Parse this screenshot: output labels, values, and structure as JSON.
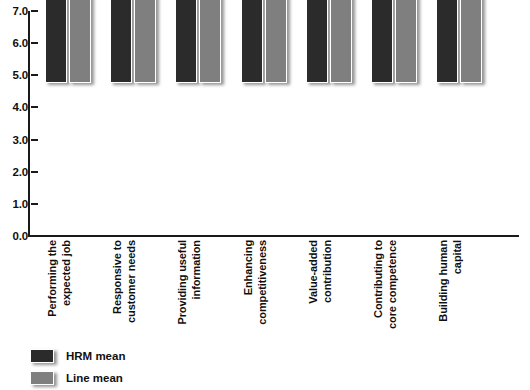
{
  "chart_data": {
    "type": "bar",
    "title": "",
    "xlabel": "",
    "ylabel": "",
    "ylim": [
      0.0,
      7.0
    ],
    "ytick_labels": [
      "7.0",
      "6.0",
      "5.0",
      "4.0",
      "3.0",
      "2.0",
      "1.0",
      "0.0"
    ],
    "ytick_values": [
      7.0,
      6.0,
      5.0,
      4.0,
      3.0,
      2.0,
      1.0,
      0.0
    ],
    "grid": false,
    "legend_position": "bottom-left",
    "categories": [
      [
        "Performing the",
        "expected job"
      ],
      [
        "Responsive to",
        "customer needs"
      ],
      [
        "Providing useful",
        "information"
      ],
      [
        "Enhancing",
        "competitiveness"
      ],
      [
        "Value-added",
        "contribution"
      ],
      [
        "Contributing to",
        "core competence"
      ],
      [
        "Building human",
        "capital"
      ]
    ],
    "series": [
      {
        "name": "HRM mean",
        "color": "#2b2b2b",
        "values": [
          4.5,
          5.0,
          4.8,
          5.0,
          5.0,
          4.8,
          4.8
        ],
        "value_labels": [
          "4.5",
          "5.0",
          "4.8",
          "5.0",
          "5.0",
          "4.8",
          "4.8"
        ]
      },
      {
        "name": "Line mean",
        "color": "#7f7f7f",
        "values": [
          3.9,
          4.2,
          4.3,
          3.8,
          4.1,
          4.2,
          4.2
        ],
        "value_labels": [
          "3.9",
          "4.2",
          "4.3",
          "3.8",
          "4.1",
          "4.2",
          "4.2"
        ]
      }
    ]
  },
  "legend": {
    "items": [
      {
        "label": "HRM mean",
        "color": "#2b2b2b"
      },
      {
        "label": "Line mean",
        "color": "#7f7f7f"
      }
    ]
  }
}
